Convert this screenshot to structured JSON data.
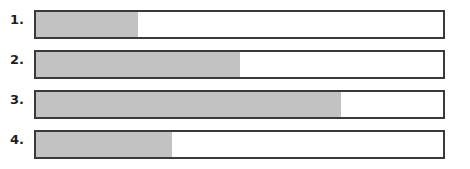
{
  "colors": {
    "fill": "#c2c2c2",
    "border": "#3a3a3a",
    "background": "#ffffff"
  },
  "bars": [
    {
      "label": "1.",
      "fill_percent": 25
    },
    {
      "label": "2.",
      "fill_percent": 50
    },
    {
      "label": "3.",
      "fill_percent": 75
    },
    {
      "label": "4.",
      "fill_percent": 33.3
    }
  ]
}
